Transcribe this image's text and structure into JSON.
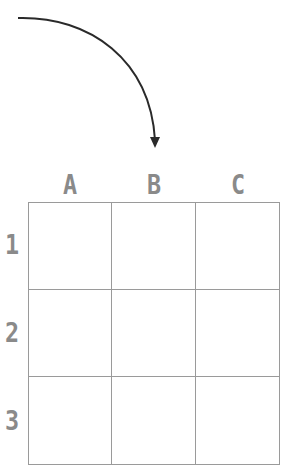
{
  "columns": [
    {
      "label": "A"
    },
    {
      "label": "B"
    },
    {
      "label": "C"
    }
  ],
  "rows": [
    {
      "label": "1"
    },
    {
      "label": "2"
    },
    {
      "label": "3"
    }
  ],
  "arrow": {
    "icon": "curved-arrow-down-icon",
    "color": "#2a2a2a"
  },
  "colors": {
    "label": "#8a8a8a",
    "grid_line": "#9a9a9a"
  }
}
